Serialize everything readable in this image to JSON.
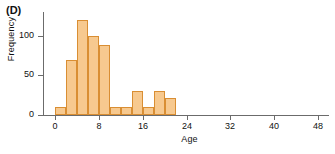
{
  "panel": {
    "label": "(D)"
  },
  "chart_data": {
    "type": "bar",
    "title": "(D)",
    "xlabel": "Age",
    "ylabel": "Frequency",
    "xlim": [
      -2,
      50
    ],
    "ylim": [
      0,
      130
    ],
    "grid": false,
    "legend": null,
    "bin_width": 2,
    "bar_color": "#f7c98f",
    "bar_edge_color": "#d98e33",
    "axis_color": "#6b6b6b",
    "xticks": [
      0,
      8,
      16,
      24,
      32,
      40,
      48
    ],
    "xtick_labels": [
      "0",
      "8",
      "16",
      "24",
      "32",
      "40",
      "48"
    ],
    "yticks": [
      0,
      50,
      100
    ],
    "ytick_labels": [
      "0",
      "50",
      "100"
    ],
    "categories": [
      "0-2",
      "2-4",
      "4-6",
      "6-8",
      "8-10",
      "10-12",
      "12-14",
      "14-16",
      "16-18",
      "18-20",
      "20-22"
    ],
    "bin_starts": [
      0,
      2,
      4,
      6,
      8,
      10,
      12,
      14,
      16,
      18,
      20
    ],
    "values": [
      10,
      70,
      120,
      100,
      88,
      10,
      10,
      30,
      10,
      30,
      22
    ]
  }
}
